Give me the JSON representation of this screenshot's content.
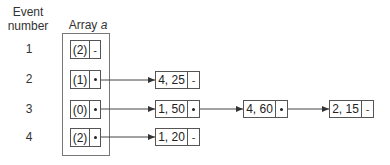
{
  "headers": {
    "event_col_line1": "Event",
    "event_col_line2": "number",
    "array_col_prefix": "Array ",
    "array_col_var": "a"
  },
  "rows": [
    {
      "event": "1",
      "index": "(2)",
      "pointer": "-"
    },
    {
      "event": "2",
      "index": "(1)",
      "pointer": "•"
    },
    {
      "event": "3",
      "index": "(0)",
      "pointer": "•"
    },
    {
      "event": "4",
      "index": "(2)",
      "pointer": "•"
    }
  ],
  "nodes": [
    {
      "id": "n1",
      "row": 2,
      "value": "4, 25",
      "next": "-"
    },
    {
      "id": "n2",
      "row": 3,
      "value": "1, 50",
      "next": "•"
    },
    {
      "id": "n3",
      "row": 3,
      "value": "4, 60",
      "next": "•"
    },
    {
      "id": "n4",
      "row": 3,
      "value": "2, 15",
      "next": "-"
    },
    {
      "id": "n5",
      "row": 4,
      "value": "1, 20",
      "next": "-"
    }
  ],
  "null_marker": "-"
}
